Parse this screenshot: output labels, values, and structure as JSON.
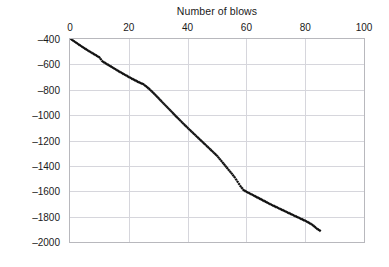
{
  "chart_data": {
    "type": "scatter",
    "title": "Number of blows",
    "xlabel": "Number of blows",
    "ylabel": "Depth below pavement surface (mm)",
    "xlim": [
      0,
      100
    ],
    "ylim": [
      -2000,
      -400
    ],
    "x_ticks": [
      0,
      20,
      40,
      60,
      80,
      100
    ],
    "y_ticks": [
      -400,
      -600,
      -800,
      -1000,
      -1200,
      -1400,
      -1600,
      -1800,
      -2000
    ],
    "x_tick_labels": [
      "0",
      "20",
      "40",
      "60",
      "80",
      "100"
    ],
    "y_tick_labels": [
      "-400",
      "-600",
      "-800",
      "-1000",
      "-1200",
      "-1400",
      "-1600",
      "-1800",
      "-2000"
    ],
    "x_axis_position": "top",
    "y_axis_inverted": false,
    "grid": true,
    "legend": false,
    "marker": "filled-diamond",
    "marker_color": "#111111",
    "series": [
      {
        "name": "DCP penetration profile",
        "x": [
          0,
          1,
          2,
          3,
          4,
          5,
          6,
          7,
          8,
          9,
          10,
          11,
          12,
          13,
          14,
          15,
          16,
          17,
          18,
          19,
          20,
          21,
          22,
          23,
          24,
          25,
          26,
          27,
          28,
          29,
          30,
          31,
          32,
          33,
          34,
          35,
          36,
          37,
          38,
          39,
          40,
          41,
          42,
          43,
          44,
          45,
          46,
          47,
          48,
          49,
          50,
          51,
          52,
          53,
          54,
          55,
          56,
          57,
          58,
          59,
          60,
          61,
          62,
          63,
          64,
          65,
          66,
          67,
          68,
          69,
          70,
          71,
          72,
          73,
          74,
          75,
          76,
          77,
          78,
          79,
          80,
          81,
          82,
          83,
          84,
          85
        ],
        "y": [
          -395,
          -412,
          -428,
          -444,
          -459,
          -474,
          -489,
          -503,
          -517,
          -531,
          -545,
          -575,
          -590,
          -604,
          -618,
          -632,
          -646,
          -660,
          -673,
          -686,
          -699,
          -712,
          -724,
          -736,
          -747,
          -757,
          -775,
          -795,
          -817,
          -840,
          -864,
          -888,
          -912,
          -936,
          -960,
          -984,
          -1008,
          -1031,
          -1054,
          -1077,
          -1100,
          -1122,
          -1144,
          -1166,
          -1188,
          -1210,
          -1232,
          -1254,
          -1276,
          -1298,
          -1320,
          -1348,
          -1376,
          -1404,
          -1432,
          -1460,
          -1490,
          -1525,
          -1560,
          -1590,
          -1604,
          -1616,
          -1628,
          -1640,
          -1652,
          -1664,
          -1676,
          -1688,
          -1700,
          -1712,
          -1723,
          -1734,
          -1745,
          -1756,
          -1767,
          -1778,
          -1789,
          -1800,
          -1811,
          -1822,
          -1833,
          -1845,
          -1858,
          -1875,
          -1895,
          -1910
        ]
      }
    ],
    "annotations": [
      {
        "note": "slope break near 25 blows at about -750 mm"
      },
      {
        "note": "slope break near 57 blows at about -1600 mm"
      }
    ]
  }
}
